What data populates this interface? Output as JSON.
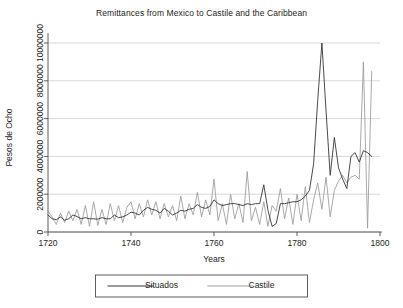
{
  "chart_data": {
    "type": "line",
    "title": "Remittances from Mexico to Castile and the Caribbean",
    "xlabel": "Years",
    "ylabel": "Pesos de Ocho",
    "xlim": [
      1720,
      1800
    ],
    "ylim": [
      0,
      10000000
    ],
    "xticks": [
      1720,
      1740,
      1760,
      1780,
      1800
    ],
    "xtick_labels": [
      "1720",
      "1740",
      "1760",
      "1780",
      "1800"
    ],
    "yticks": [
      0,
      2000000,
      4000000,
      6000000,
      8000000,
      10000000
    ],
    "ytick_labels": [
      "0",
      "2000000",
      "4000000",
      "6000000",
      "8000000",
      "10000000"
    ],
    "grid": true,
    "legend_position": "bottom",
    "colors": {
      "situados": "#2b2b2b",
      "castile": "#9a9a9a"
    },
    "series": [
      {
        "name": "Situados",
        "color": "#2b2b2b",
        "x": [
          1720,
          1721,
          1722,
          1723,
          1724,
          1725,
          1726,
          1727,
          1728,
          1729,
          1730,
          1731,
          1732,
          1733,
          1734,
          1735,
          1736,
          1737,
          1738,
          1739,
          1740,
          1741,
          1742,
          1743,
          1744,
          1745,
          1746,
          1747,
          1748,
          1749,
          1750,
          1751,
          1752,
          1753,
          1754,
          1755,
          1756,
          1757,
          1758,
          1759,
          1760,
          1761,
          1762,
          1763,
          1764,
          1765,
          1766,
          1767,
          1768,
          1769,
          1770,
          1771,
          1772,
          1773,
          1774,
          1775,
          1776,
          1777,
          1778,
          1779,
          1780,
          1781,
          1782,
          1783,
          1784,
          1785,
          1786,
          1787,
          1788,
          1789,
          1790,
          1791,
          1792,
          1793,
          1794,
          1795,
          1796,
          1797,
          1798
        ],
        "values": [
          900000,
          700000,
          650000,
          800000,
          620000,
          700000,
          900000,
          820000,
          700000,
          760000,
          700000,
          700000,
          680000,
          760000,
          700000,
          700000,
          900000,
          760000,
          800000,
          900000,
          1050000,
          1000000,
          900000,
          1150000,
          1300000,
          1200000,
          1150000,
          1000000,
          1250000,
          1100000,
          900000,
          1000000,
          1150000,
          1100000,
          1200000,
          1250000,
          1450000,
          1300000,
          1250000,
          1350000,
          1700000,
          1500000,
          1400000,
          1450000,
          1500000,
          1500000,
          1450000,
          1400000,
          1500000,
          1450000,
          1500000,
          1500000,
          2500000,
          1150000,
          300000,
          450000,
          1500000,
          1500000,
          1550000,
          1600000,
          1600000,
          1700000,
          1900000,
          2200000,
          3600000,
          7000000,
          10000000,
          6400000,
          3000000,
          5000000,
          3400000,
          2800000,
          2300000,
          4000000,
          4200000,
          3700000,
          4300000,
          4200000,
          4000000
        ]
      },
      {
        "name": "Castile",
        "color": "#9a9a9a",
        "x": [
          1720,
          1721,
          1722,
          1723,
          1724,
          1725,
          1726,
          1727,
          1728,
          1729,
          1730,
          1731,
          1732,
          1733,
          1734,
          1735,
          1736,
          1737,
          1738,
          1739,
          1740,
          1741,
          1742,
          1743,
          1744,
          1745,
          1746,
          1747,
          1748,
          1749,
          1750,
          1751,
          1752,
          1753,
          1754,
          1755,
          1756,
          1757,
          1758,
          1759,
          1760,
          1761,
          1762,
          1763,
          1764,
          1765,
          1766,
          1767,
          1768,
          1769,
          1770,
          1771,
          1772,
          1773,
          1774,
          1775,
          1776,
          1777,
          1778,
          1779,
          1780,
          1781,
          1782,
          1783,
          1784,
          1785,
          1786,
          1787,
          1788,
          1789,
          1790,
          1791,
          1792,
          1793,
          1794,
          1795,
          1796,
          1797,
          1798
        ],
        "values": [
          1100000,
          800000,
          400000,
          1000000,
          500000,
          1100000,
          600000,
          1200000,
          400000,
          1400000,
          300000,
          1600000,
          350000,
          1200000,
          400000,
          1500000,
          600000,
          1400000,
          500000,
          1300000,
          1600000,
          700000,
          1500000,
          800000,
          1700000,
          900000,
          1600000,
          700000,
          1500000,
          800000,
          1400000,
          600000,
          1900000,
          700000,
          1500000,
          900000,
          2100000,
          800000,
          1700000,
          900000,
          2800000,
          600000,
          1500000,
          400000,
          2000000,
          700000,
          1500000,
          500000,
          3200000,
          600000,
          1300000,
          400000,
          1600000,
          300000,
          1400000,
          1100000,
          2300000,
          700000,
          1800000,
          400000,
          2000000,
          600000,
          2400000,
          500000,
          1700000,
          2600000,
          1200000,
          2900000,
          800000,
          2200000,
          2700000,
          3000000,
          2600000,
          2900000,
          3000000,
          2800000,
          9000000,
          200000,
          8500000
        ]
      }
    ]
  },
  "legend": {
    "items": [
      {
        "label": "Situados"
      },
      {
        "label": "Castile"
      }
    ]
  }
}
